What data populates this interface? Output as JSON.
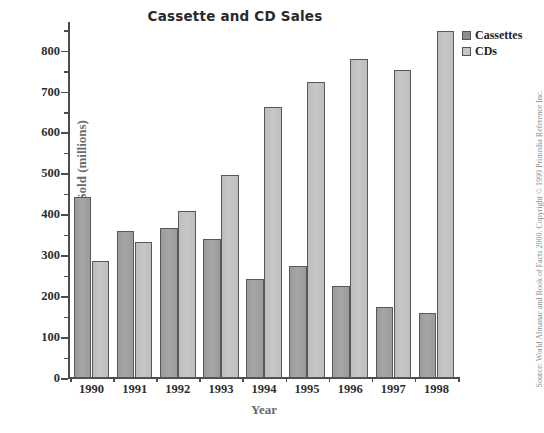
{
  "chart_data": {
    "type": "bar",
    "title": "Cassette and CD Sales",
    "xlabel": "Year",
    "ylabel": "Number Sold (millions)",
    "categories": [
      "1990",
      "1991",
      "1992",
      "1993",
      "1994",
      "1995",
      "1996",
      "1997",
      "1998"
    ],
    "series": [
      {
        "name": "Cassettes",
        "color": "#a0a0a0",
        "values": [
          442,
          360,
          366,
          340,
          243,
          273,
          226,
          174,
          159
        ]
      },
      {
        "name": "CDs",
        "color": "#c2c2c2",
        "values": [
          287,
          333,
          407,
          495,
          662,
          723,
          779,
          753,
          847
        ]
      }
    ],
    "ylim": [
      0,
      870
    ],
    "yticks": [
      0,
      100,
      200,
      300,
      400,
      500,
      600,
      700,
      800
    ],
    "ytick_labels": [
      "0",
      "100",
      "200",
      "300",
      "400",
      "500",
      "600",
      "700",
      "800"
    ],
    "yminor_ticks": [
      50,
      150,
      250,
      350,
      450,
      550,
      650,
      750,
      850
    ],
    "grid": false,
    "legend_position": "upper right"
  },
  "legend": {
    "items": [
      {
        "label": "Cassettes",
        "swatch": "cassettes"
      },
      {
        "label": "CDs",
        "swatch": "cds"
      }
    ]
  },
  "source": {
    "text": "Source: World Almanac and Book of Facts 2000. Copyright © 1999 Primedia Reference Inc."
  },
  "colors": {
    "cassettes": "#a0a0a0",
    "cds": "#c2c2c2",
    "axis": "#4c4c4c",
    "axis_title": "#6a6a6a",
    "title": "#2a2a2a",
    "background": "#ffffff"
  }
}
